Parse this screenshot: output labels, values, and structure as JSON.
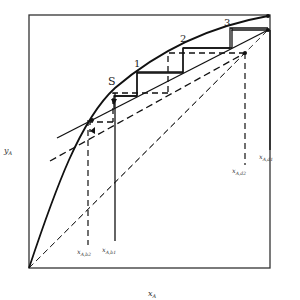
{
  "diagram": {
    "type": "McCabe-Thiele style stage construction (two operating lines)",
    "axes": {
      "x_label": "x_A",
      "y_label": "y_A"
    },
    "stage_labels": [
      "1",
      "2",
      "3"
    ],
    "feed_stage_label": "S",
    "markers": {
      "x_A_b1": "x_A,b1",
      "x_A_b2": "x_A,b2",
      "x_A_d1": "x_A,d1",
      "x_A_d2": "x_A,d2"
    },
    "display": {
      "x_label_main": "x",
      "x_label_sub": "A",
      "y_label_main": "y",
      "y_label_sub": "A",
      "b1_main": "x",
      "b1_sub": "A,b1",
      "b2_main": "x",
      "b2_sub": "A,b2",
      "d1_main": "x",
      "d1_sub": "A,d1",
      "d2_main": "x",
      "d2_sub": "A,d2"
    },
    "colors": {
      "line": "#1a1a1a",
      "frame": "#333333",
      "background": "#ffffff"
    }
  }
}
